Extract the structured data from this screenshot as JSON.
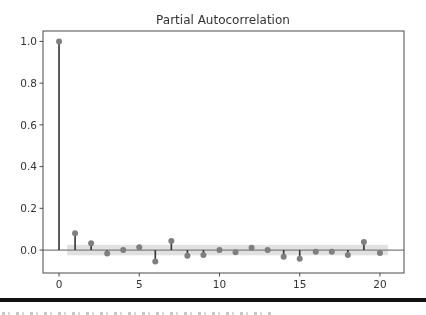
{
  "chart_data": {
    "type": "stem",
    "title": "Partial Autocorrelation",
    "xlabel": "",
    "ylabel": "",
    "x": [
      0,
      1,
      2,
      3,
      4,
      5,
      6,
      7,
      8,
      9,
      10,
      11,
      12,
      13,
      14,
      15,
      16,
      17,
      18,
      19,
      20
    ],
    "values": [
      1.0,
      0.08,
      0.033,
      -0.017,
      0.0,
      0.013,
      -0.055,
      0.043,
      -0.027,
      -0.024,
      0.0,
      -0.011,
      0.011,
      0.0,
      -0.032,
      -0.042,
      -0.008,
      -0.008,
      -0.024,
      0.038,
      -0.014
    ],
    "confidence_interval": {
      "lower": -0.025,
      "upper": 0.025,
      "x_range": [
        0.5,
        20.5
      ]
    },
    "xlim": [
      -1,
      21.5
    ],
    "ylim": [
      -0.11,
      1.05
    ],
    "xticks": [
      0,
      5,
      10,
      15,
      20
    ],
    "xtick_labels": [
      "0",
      "5",
      "10",
      "15",
      "20"
    ],
    "yticks": [
      0.0,
      0.2,
      0.4,
      0.6,
      0.8,
      1.0
    ],
    "ytick_labels": [
      "0.0",
      "0.2",
      "0.4",
      "0.6",
      "0.8",
      "1.0"
    ],
    "grid": false,
    "legend": "none",
    "colors": {
      "stem": "#333333",
      "marker": "#7f7f7f",
      "zero_line": "#7f7f7f",
      "band": "#d9d9d9",
      "axes": "#4a4a4a"
    }
  }
}
